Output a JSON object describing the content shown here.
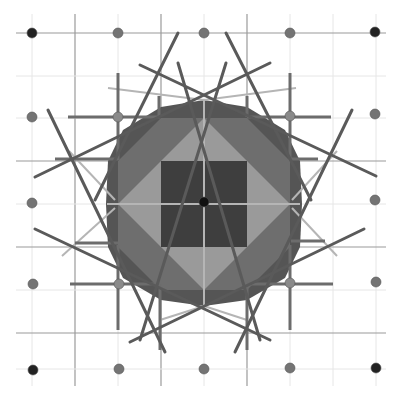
{
  "diagram": {
    "width": 401,
    "height": 395,
    "background": "#ffffff",
    "colors": {
      "grid_light": "#e6e6e6",
      "grid_dark": "#9a9a9a",
      "octagon_outer": "#555555",
      "octagon_mid": "#6e6e6e",
      "diamond": "#9a9a9a",
      "center_square": "#3e3e3e",
      "star_line": "#5a5a5a",
      "cross_line": "#6c6c6c",
      "faint_line": "#b5b5b5",
      "dot_corner": "#222222",
      "dot_edge": "#747474",
      "dot_inner": "#8a8a8a",
      "dot_center": "#111111"
    },
    "grid": {
      "x": [
        32,
        75,
        118,
        161,
        204,
        247,
        290,
        333,
        376
      ],
      "y": [
        33,
        76,
        118,
        161,
        204,
        247,
        290,
        333,
        369
      ],
      "x_range": [
        16,
        386
      ],
      "y_range": [
        14,
        386
      ],
      "dark_x": [
        75,
        161,
        247
      ],
      "dark_y": [
        33,
        161,
        247,
        333
      ]
    },
    "octagon": {
      "points": [
        [
          204,
          100
        ],
        [
          247,
          107
        ],
        [
          285,
          130
        ],
        [
          300,
          161
        ],
        [
          302,
          204
        ],
        [
          300,
          247
        ],
        [
          285,
          278
        ],
        [
          247,
          300
        ],
        [
          204,
          306
        ],
        [
          161,
          300
        ],
        [
          123,
          278
        ],
        [
          108,
          247
        ],
        [
          106,
          204
        ],
        [
          108,
          161
        ],
        [
          123,
          130
        ],
        [
          161,
          107
        ]
      ]
    },
    "mid_band": {
      "points": [
        [
          161,
          118
        ],
        [
          247,
          118
        ],
        [
          290,
          161
        ],
        [
          290,
          247
        ],
        [
          247,
          290
        ],
        [
          161,
          290
        ],
        [
          118,
          247
        ],
        [
          118,
          161
        ]
      ]
    },
    "diamond": {
      "points": [
        [
          204,
          118
        ],
        [
          290,
          204
        ],
        [
          204,
          290
        ],
        [
          118,
          204
        ]
      ]
    },
    "center_square": {
      "x": 161,
      "y": 161,
      "w": 86,
      "h": 86
    },
    "star_lines": [
      {
        "x1": 178,
        "y1": 33,
        "x2": 95,
        "y2": 200
      },
      {
        "x1": 226,
        "y1": 33,
        "x2": 311,
        "y2": 200
      },
      {
        "x1": 140,
        "y1": 65,
        "x2": 376,
        "y2": 176
      },
      {
        "x1": 270,
        "y1": 63,
        "x2": 35,
        "y2": 177
      },
      {
        "x1": 48,
        "y1": 110,
        "x2": 165,
        "y2": 352
      },
      {
        "x1": 352,
        "y1": 110,
        "x2": 235,
        "y2": 352
      },
      {
        "x1": 35,
        "y1": 229,
        "x2": 270,
        "y2": 340
      },
      {
        "x1": 364,
        "y1": 229,
        "x2": 130,
        "y2": 342
      },
      {
        "x1": 226,
        "y1": 63,
        "x2": 140,
        "y2": 340
      },
      {
        "x1": 178,
        "y1": 63,
        "x2": 260,
        "y2": 340
      }
    ],
    "cross_lines": [
      {
        "x1": 118,
        "y1": 73,
        "x2": 118,
        "y2": 160
      },
      {
        "x1": 68,
        "y1": 117,
        "x2": 160,
        "y2": 117
      },
      {
        "x1": 159,
        "y1": 96,
        "x2": 159,
        "y2": 117
      },
      {
        "x1": 290,
        "y1": 73,
        "x2": 290,
        "y2": 160
      },
      {
        "x1": 247,
        "y1": 117,
        "x2": 331,
        "y2": 117
      },
      {
        "x1": 247,
        "y1": 96,
        "x2": 247,
        "y2": 117
      },
      {
        "x1": 55,
        "y1": 159,
        "x2": 118,
        "y2": 159
      },
      {
        "x1": 290,
        "y1": 159,
        "x2": 318,
        "y2": 159
      },
      {
        "x1": 118,
        "y1": 245,
        "x2": 118,
        "y2": 330
      },
      {
        "x1": 70,
        "y1": 284,
        "x2": 160,
        "y2": 284
      },
      {
        "x1": 160,
        "y1": 284,
        "x2": 160,
        "y2": 350
      },
      {
        "x1": 290,
        "y1": 245,
        "x2": 290,
        "y2": 330
      },
      {
        "x1": 247,
        "y1": 284,
        "x2": 333,
        "y2": 284
      },
      {
        "x1": 247,
        "y1": 284,
        "x2": 247,
        "y2": 350
      },
      {
        "x1": 291,
        "y1": 241,
        "x2": 325,
        "y2": 241
      },
      {
        "x1": 75,
        "y1": 243,
        "x2": 118,
        "y2": 243
      }
    ],
    "faint_lines": [
      {
        "x1": 69,
        "y1": 151,
        "x2": 115,
        "y2": 200
      },
      {
        "x1": 108,
        "y1": 88,
        "x2": 204,
        "y2": 100
      },
      {
        "x1": 296,
        "y1": 88,
        "x2": 204,
        "y2": 100
      },
      {
        "x1": 337,
        "y1": 151,
        "x2": 292,
        "y2": 200
      },
      {
        "x1": 62,
        "y1": 256,
        "x2": 115,
        "y2": 208
      },
      {
        "x1": 337,
        "y1": 256,
        "x2": 292,
        "y2": 208
      },
      {
        "x1": 160,
        "y1": 320,
        "x2": 204,
        "y2": 306
      },
      {
        "x1": 247,
        "y1": 320,
        "x2": 204,
        "y2": 306
      },
      {
        "x1": 107,
        "y1": 204,
        "x2": 300,
        "y2": 204
      },
      {
        "x1": 204,
        "y1": 100,
        "x2": 204,
        "y2": 306
      }
    ],
    "dots": [
      {
        "cx": 32,
        "cy": 33,
        "r": 5,
        "kind": "corner"
      },
      {
        "cx": 118,
        "cy": 33,
        "r": 5,
        "kind": "edge"
      },
      {
        "cx": 204,
        "cy": 33,
        "r": 5,
        "kind": "edge"
      },
      {
        "cx": 290,
        "cy": 33,
        "r": 5,
        "kind": "edge"
      },
      {
        "cx": 375,
        "cy": 32,
        "r": 5,
        "kind": "corner"
      },
      {
        "cx": 32,
        "cy": 117,
        "r": 5,
        "kind": "edge"
      },
      {
        "cx": 118,
        "cy": 117,
        "r": 5,
        "kind": "inner"
      },
      {
        "cx": 290,
        "cy": 116,
        "r": 5,
        "kind": "inner"
      },
      {
        "cx": 375,
        "cy": 114,
        "r": 5,
        "kind": "edge"
      },
      {
        "cx": 32,
        "cy": 203,
        "r": 5,
        "kind": "edge"
      },
      {
        "cx": 204,
        "cy": 202,
        "r": 5,
        "kind": "center"
      },
      {
        "cx": 375,
        "cy": 200,
        "r": 5,
        "kind": "edge"
      },
      {
        "cx": 33,
        "cy": 284,
        "r": 5,
        "kind": "edge"
      },
      {
        "cx": 119,
        "cy": 284,
        "r": 5,
        "kind": "inner"
      },
      {
        "cx": 290,
        "cy": 283,
        "r": 5,
        "kind": "inner"
      },
      {
        "cx": 376,
        "cy": 282,
        "r": 5,
        "kind": "edge"
      },
      {
        "cx": 33,
        "cy": 370,
        "r": 5,
        "kind": "corner"
      },
      {
        "cx": 119,
        "cy": 369,
        "r": 5,
        "kind": "edge"
      },
      {
        "cx": 204,
        "cy": 369,
        "r": 5,
        "kind": "edge"
      },
      {
        "cx": 290,
        "cy": 368,
        "r": 5,
        "kind": "edge"
      },
      {
        "cx": 376,
        "cy": 368,
        "r": 5,
        "kind": "corner"
      }
    ]
  }
}
